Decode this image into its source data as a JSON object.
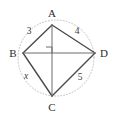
{
  "figure": {
    "background_color": "#ffffff",
    "stroke_color": "#4a4a4a",
    "circle_color": "#b9b9b9",
    "label_color": "#2b2b2b"
  },
  "vertices": [
    {
      "name": "A",
      "label": "A",
      "x": 52,
      "y": 25,
      "label_x": 52,
      "label_y": 17
    },
    {
      "name": "B",
      "label": "B",
      "x": 23,
      "y": 53,
      "label_x": 13,
      "label_y": 57
    },
    {
      "name": "C",
      "label": "C",
      "x": 52,
      "y": 96,
      "label_x": 52,
      "label_y": 110
    },
    {
      "name": "D",
      "label": "D",
      "x": 95,
      "y": 53,
      "label_x": 104,
      "label_y": 57
    }
  ],
  "sides": [
    {
      "name": "AB",
      "label": "3",
      "value": 3,
      "italic": false,
      "label_x": 29,
      "label_y": 34
    },
    {
      "name": "AD",
      "label": "4",
      "value": 4,
      "italic": false,
      "label_x": 77,
      "label_y": 34
    },
    {
      "name": "BC",
      "label": "x",
      "value": null,
      "italic": true,
      "label_x": 26,
      "label_y": 79
    },
    {
      "name": "CD",
      "label": "5",
      "value": 5,
      "italic": false,
      "label_x": 80,
      "label_y": 80
    }
  ],
  "diagonals": [
    {
      "name": "AC",
      "from": "A",
      "to": "C"
    },
    {
      "name": "BD",
      "from": "B",
      "to": "D"
    }
  ],
  "right_angle": {
    "name": "right-angle-mark",
    "at_x": 52,
    "at_y": 53,
    "size": 6,
    "quadrant": "upper-left"
  },
  "circumcircle": {
    "center_x": 56,
    "center_y": 58,
    "radius": 38,
    "style": "dotted"
  }
}
